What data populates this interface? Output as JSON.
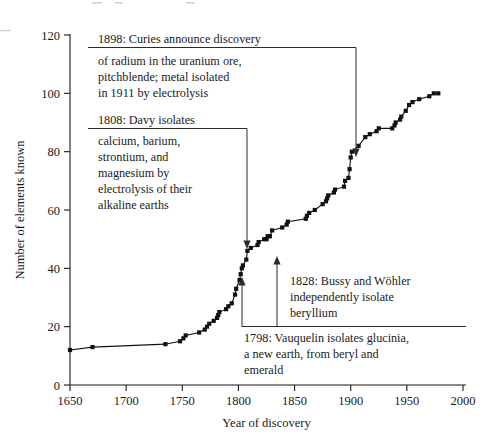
{
  "chart_data": {
    "type": "line",
    "title": "",
    "xlabel": "Year of discovery",
    "ylabel": "Number of elements known",
    "xlim": [
      1650,
      2000
    ],
    "ylim": [
      0,
      120
    ],
    "xticks": [
      1650,
      1700,
      1750,
      1800,
      1850,
      1900,
      1950,
      2000
    ],
    "yticks": [
      0,
      20,
      40,
      60,
      80,
      100,
      120
    ],
    "grid": false,
    "legend": null,
    "marker": "square",
    "series": [
      {
        "name": "Elements known",
        "x": [
          1650,
          1670,
          1735,
          1748,
          1751,
          1753,
          1765,
          1770,
          1772,
          1774,
          1778,
          1781,
          1782,
          1783,
          1789,
          1791,
          1794,
          1797,
          1798,
          1801,
          1802,
          1803,
          1804,
          1807,
          1808,
          1811,
          1817,
          1818,
          1823,
          1825,
          1826,
          1828,
          1830,
          1839,
          1843,
          1844,
          1860,
          1861,
          1863,
          1868,
          1875,
          1878,
          1879,
          1880,
          1885,
          1886,
          1894,
          1895,
          1898,
          1899,
          1900,
          1901,
          1907,
          1913,
          1917,
          1923,
          1925,
          1937,
          1939,
          1940,
          1944,
          1945,
          1949,
          1952,
          1955,
          1961,
          1970,
          1974,
          1978
        ],
        "y": [
          12,
          13,
          14,
          15,
          16,
          17,
          18,
          19,
          20,
          21,
          22,
          23,
          24,
          25,
          26,
          27,
          28,
          31,
          33,
          36,
          38,
          40,
          41,
          43,
          46,
          47,
          48,
          49,
          50,
          50,
          51,
          51,
          53,
          54,
          55,
          56,
          57,
          58,
          59,
          60,
          62,
          63,
          64,
          65,
          66,
          67,
          68,
          70,
          71,
          74,
          78,
          80,
          82,
          85,
          86,
          87,
          88,
          88,
          89,
          90,
          91,
          92,
          94,
          96,
          97,
          98,
          99,
          100,
          100
        ]
      }
    ],
    "annotations": [
      {
        "id": "anno-1898",
        "head": "1898: Curies announce discovery",
        "lines": [
          "of radium in the uranium ore,",
          "pitchblende; metal isolated",
          "in 1911 by electrolysis"
        ],
        "points_to": {
          "x": 1900,
          "y": 88
        }
      },
      {
        "id": "anno-1808",
        "head": "1808: Davy isolates",
        "lines": [
          "calcium, barium,",
          "strontium, and",
          "magnesium by",
          "electrolysis of their",
          "alkaline earths"
        ],
        "points_to": {
          "x": 1808,
          "y": 46
        }
      },
      {
        "id": "anno-1828",
        "head": "1828: Bussy and Wöhler",
        "lines": [
          "independently isolate",
          "beryllium"
        ],
        "points_to": {
          "x": 1828,
          "y": 51
        }
      },
      {
        "id": "anno-1798",
        "head": "1798: Vauquelin isolates glucinia,",
        "lines": [
          "a new earth, from beryl and",
          "emerald"
        ],
        "points_to": {
          "x": 1798,
          "y": 33
        }
      }
    ]
  },
  "axis": {
    "x_title": "Year of discovery",
    "y_title": "Number of elements known",
    "x_tick_labels": [
      "1650",
      "1700",
      "1750",
      "1800",
      "1850",
      "1900",
      "1950",
      "2000"
    ],
    "y_tick_labels": [
      "0",
      "20",
      "40",
      "60",
      "80",
      "100",
      "120"
    ]
  },
  "annotations": {
    "a1898": {
      "l0": "1898: Curies announce discovery",
      "l1": "of radium in the uranium ore,",
      "l2": "pitchblende; metal isolated",
      "l3": "in 1911 by electrolysis"
    },
    "a1808": {
      "l0": "1808: Davy isolates",
      "l1": "calcium, barium,",
      "l2": "strontium, and",
      "l3": "magnesium by",
      "l4": "electrolysis of their",
      "l5": "alkaline earths"
    },
    "a1828": {
      "l0": "1828: Bussy and Wöhler",
      "l1": "independently isolate",
      "l2": "beryllium"
    },
    "a1798": {
      "l0": "1798: Vauquelin isolates glucinia,",
      "l1": "a new earth, from beryl and",
      "l2": "emerald"
    }
  },
  "colors": {
    "ink": "#1a1a1a",
    "line": "#111111",
    "leader": "#2b2b2b",
    "background": "#ffffff"
  }
}
